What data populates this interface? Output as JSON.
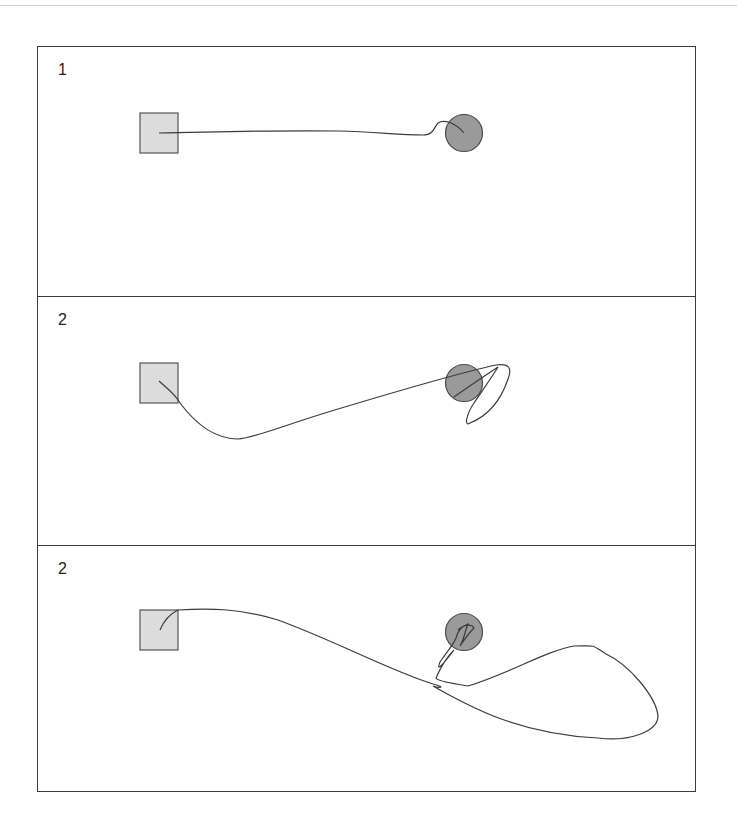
{
  "figure": {
    "colors": {
      "frame": "#3a3a3a",
      "square_fill": "#dcdcdc",
      "square_stroke": "#555555",
      "circle_fill": "#9a9a9a",
      "circle_stroke": "#4a4a4a",
      "path_stroke": "#3c3c3c"
    },
    "panels": [
      {
        "label": "1",
        "start_shape": "square",
        "goal_shape": "circle",
        "path_description": "nearly straight trajectory from square to circle"
      },
      {
        "label": "2",
        "start_shape": "square",
        "goal_shape": "circle",
        "path_description": "dips downward then rises to circle, overshoots with a loop"
      },
      {
        "label": "2",
        "start_shape": "square",
        "goal_shape": "circle",
        "path_description": "long overshoot loop to the lower right before returning into circle with tangled end"
      }
    ]
  }
}
